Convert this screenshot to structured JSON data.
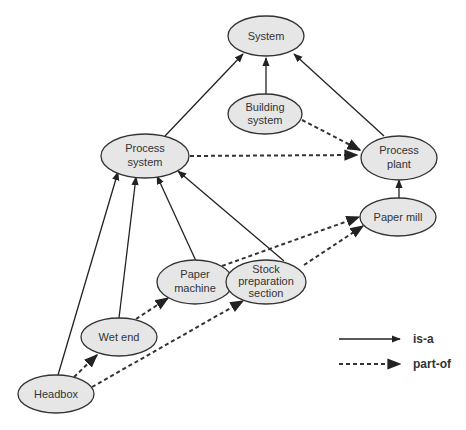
{
  "diagram": {
    "nodes": {
      "system": {
        "line1": "System"
      },
      "building_system": {
        "line1": "Building",
        "line2": "system"
      },
      "process_system": {
        "line1": "Process",
        "line2": "system"
      },
      "process_plant": {
        "line1": "Process",
        "line2": "plant"
      },
      "paper_mill": {
        "line1": "Paper mill"
      },
      "paper_machine": {
        "line1": "Paper",
        "line2": "machine"
      },
      "stock_preparation": {
        "line1": "Stock",
        "line2": "preparation",
        "line3": "section"
      },
      "wet_end": {
        "line1": "Wet end"
      },
      "headbox": {
        "line1": "Headbox"
      }
    },
    "edges": [
      {
        "from": "Process system",
        "to": "System",
        "type": "is-a"
      },
      {
        "from": "Building system",
        "to": "System",
        "type": "is-a"
      },
      {
        "from": "Process plant",
        "to": "System",
        "type": "is-a"
      },
      {
        "from": "Paper mill",
        "to": "Process plant",
        "type": "is-a"
      },
      {
        "from": "Headbox",
        "to": "Process system",
        "type": "is-a"
      },
      {
        "from": "Wet end",
        "to": "Process system",
        "type": "is-a"
      },
      {
        "from": "Paper machine",
        "to": "Process system",
        "type": "is-a"
      },
      {
        "from": "Stock preparation section",
        "to": "Process system",
        "type": "is-a"
      },
      {
        "from": "Building system",
        "to": "Process plant",
        "type": "part-of"
      },
      {
        "from": "Process system",
        "to": "Process plant",
        "type": "part-of"
      },
      {
        "from": "Paper machine",
        "to": "Paper mill",
        "type": "part-of"
      },
      {
        "from": "Stock preparation section",
        "to": "Paper mill",
        "type": "part-of"
      },
      {
        "from": "Wet end",
        "to": "Paper machine",
        "type": "part-of"
      },
      {
        "from": "Headbox",
        "to": "Wet end",
        "type": "part-of"
      },
      {
        "from": "Headbox",
        "to": "Stock preparation section",
        "type": "part-of"
      }
    ],
    "legend": {
      "isa_label": "is-a",
      "partof_label": "part-of"
    }
  }
}
